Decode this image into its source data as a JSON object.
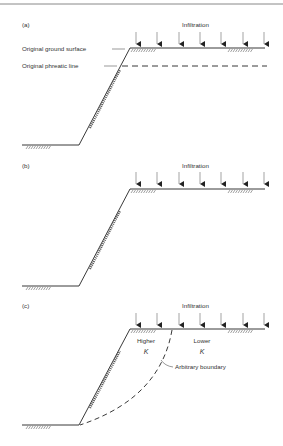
{
  "figure": {
    "panels": [
      {
        "id": "a",
        "label": "(a)",
        "infiltration_label": "Infiltration",
        "annotations": {
          "ground_surface": "Original ground surface",
          "phreatic_line": "Original phreatic line"
        }
      },
      {
        "id": "b",
        "label": "(b)",
        "infiltration_label": "Infiltration"
      },
      {
        "id": "c",
        "label": "(c)",
        "infiltration_label": "Infiltration",
        "zones": {
          "higher": "Higher",
          "lower": "Lower",
          "k_symbol": "K"
        },
        "boundary_label": "Arbitrary boundary"
      }
    ],
    "colors": {
      "line": "#222222",
      "text": "#333333",
      "rule": "#888888"
    }
  }
}
